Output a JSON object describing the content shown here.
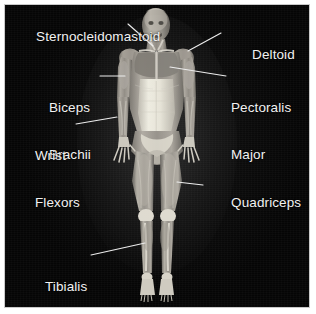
{
  "figure": {
    "view": "anterior",
    "background_color": "#050505",
    "label_color": "#f2f2f2",
    "leader_line_color": "#ededed",
    "frame_color": "#c9c9c9",
    "canvas": {
      "width": 316,
      "height": 314
    }
  },
  "labels": {
    "sternocleidomastoid": "Sternocleidomastoid",
    "deltoid": "Deltoid",
    "biceps_brachii_line1": "Biceps",
    "biceps_brachii_line2": "Brachii",
    "pectoralis_major_line1": "Pectoralis",
    "pectoralis_major_line2": "Major",
    "wrist_flexors_line1": "Wrist",
    "wrist_flexors_line2": "Flexors",
    "quadriceps": "Quadriceps",
    "tibialis_anterior_line1": "Tibialis",
    "tibialis_anterior_line2": "Anterior"
  },
  "annotations": [
    {
      "name": "sternocleidomastoid",
      "side": "left",
      "target": "neck"
    },
    {
      "name": "deltoid",
      "side": "right",
      "target": "shoulder"
    },
    {
      "name": "biceps-brachii",
      "side": "left",
      "target": "upper-arm"
    },
    {
      "name": "pectoralis-major",
      "side": "right",
      "target": "chest"
    },
    {
      "name": "wrist-flexors",
      "side": "left",
      "target": "forearm"
    },
    {
      "name": "quadriceps",
      "side": "right",
      "target": "thigh"
    },
    {
      "name": "tibialis-anterior",
      "side": "left",
      "target": "shin"
    }
  ]
}
